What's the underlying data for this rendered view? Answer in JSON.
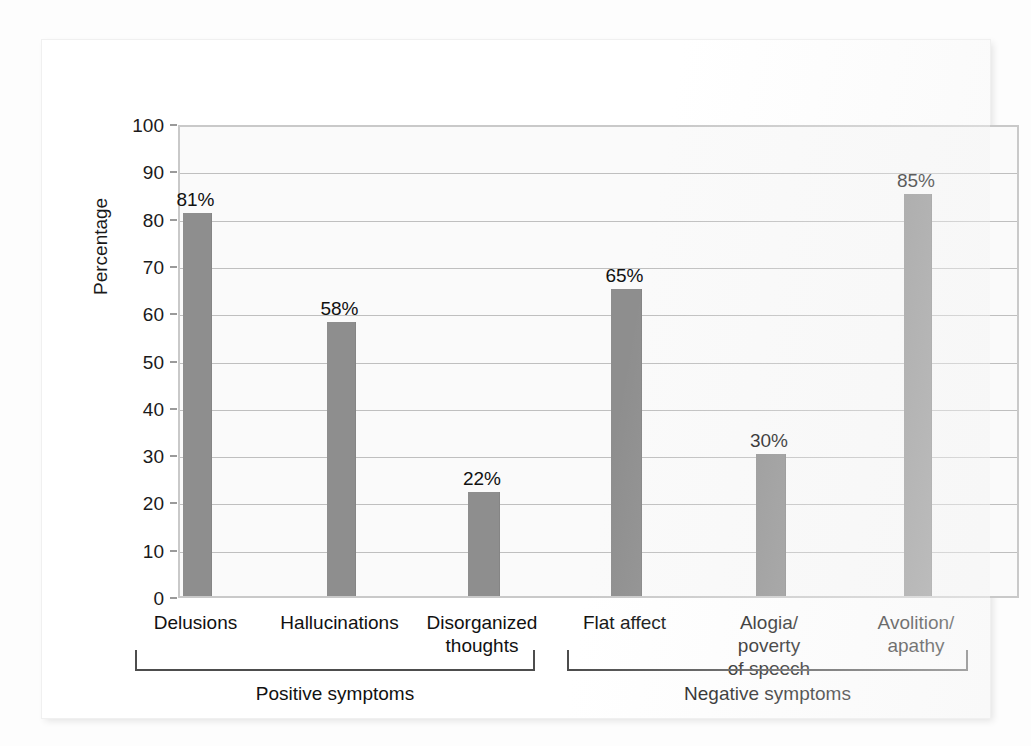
{
  "chart_data": {
    "type": "bar",
    "title": "",
    "subtitle": "",
    "xlabel": "",
    "ylabel": "Percentage",
    "ylim": [
      0,
      100
    ],
    "ytick_labels": [
      "100",
      "90",
      "80",
      "70",
      "60",
      "50",
      "40",
      "30",
      "20",
      "10",
      "0"
    ],
    "yticks": [
      100,
      90,
      80,
      70,
      60,
      50,
      40,
      30,
      20,
      10,
      0
    ],
    "grid": true,
    "legend": "none",
    "categories": [
      "Delusions",
      "Hallucinations",
      "Disorganized\nthoughts",
      "Flat affect",
      "Alogia/\npoverty\nof speech",
      "Avolition/\napathy"
    ],
    "values": [
      81,
      58,
      22,
      65,
      30,
      85
    ],
    "value_labels": [
      "81%",
      "58%",
      "22%",
      "65%",
      "30%",
      "85%"
    ],
    "bar_color": "#8e8e8e",
    "groups": [
      {
        "label": "Positive symptoms",
        "categories": [
          "Delusions",
          "Hallucinations",
          "Disorganized thoughts"
        ]
      },
      {
        "label": "Negative symptoms",
        "categories": [
          "Flat affect",
          "Alogia/poverty of speech",
          "Avolition/apathy"
        ]
      }
    ]
  }
}
